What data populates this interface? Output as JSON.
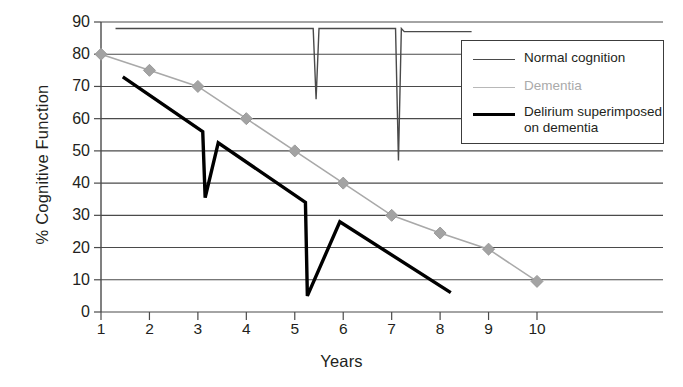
{
  "chart_data": {
    "type": "line",
    "title": "",
    "xlabel": "Years",
    "ylabel": "% Cognitive Function",
    "xlim": [
      1,
      10
    ],
    "ylim": [
      0,
      90
    ],
    "xticks": [
      "1",
      "2",
      "3",
      "4",
      "5",
      "6",
      "7",
      "8",
      "9",
      "10"
    ],
    "yticks": [
      "0",
      "10",
      "20",
      "30",
      "40",
      "50",
      "60",
      "70",
      "80",
      "90"
    ],
    "grid": true,
    "legend_position": "top-right",
    "series": [
      {
        "name": "Normal cognition",
        "color": "#4a4a4a",
        "width": 1.4,
        "marker": "none",
        "description": "Flat near 88% with two brief sharp dips (delirium episodes) with full recovery",
        "points": [
          [
            1.3,
            88
          ],
          [
            5.38,
            88
          ],
          [
            5.44,
            66
          ],
          [
            5.5,
            88
          ],
          [
            5.58,
            88
          ],
          [
            7.08,
            88
          ],
          [
            7.14,
            47
          ],
          [
            7.2,
            88
          ],
          [
            7.26,
            87
          ],
          [
            8.65,
            87
          ]
        ]
      },
      {
        "name": "Dementia",
        "color": "#a9a9a9",
        "width": 1.6,
        "marker": "diamond",
        "description": "Steady decline from 80% at year 1 to 9.5% at year 10",
        "x": [
          1,
          2,
          3,
          4,
          5,
          6,
          7,
          8,
          9,
          10
        ],
        "values": [
          80,
          75,
          70,
          60,
          50,
          40,
          30,
          24.5,
          19.5,
          9.5
        ]
      },
      {
        "name": "Delirium superimposed on dementia",
        "color": "#000000",
        "width": 3.4,
        "marker": "none",
        "description": "Accelerated decline with two acute delirium drops and incomplete recovery",
        "points": [
          [
            1.45,
            73
          ],
          [
            3.1,
            56
          ],
          [
            3.15,
            35.5
          ],
          [
            3.42,
            52.5
          ],
          [
            5.22,
            34
          ],
          [
            5.26,
            5
          ],
          [
            5.93,
            28
          ],
          [
            8.22,
            6
          ]
        ]
      }
    ]
  },
  "axis": {
    "ylabel": "% Cognitive Function",
    "xlabel": "Years"
  },
  "legend": {
    "items": [
      {
        "label": "Normal cognition",
        "color": "#4a4a4a",
        "width": 1.6
      },
      {
        "label": "Dementia",
        "color": "#b8b8b8",
        "width": 1.6
      },
      {
        "label": "Delirium superimposed\non dementia",
        "color": "#000000",
        "width": 3.2
      }
    ]
  }
}
